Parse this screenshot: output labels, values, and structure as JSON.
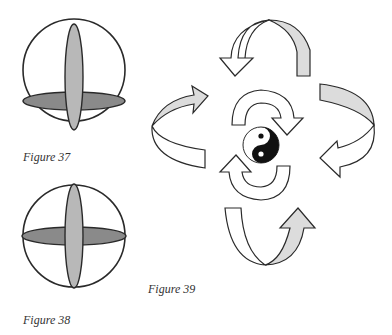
{
  "figures": [
    {
      "id": "37",
      "caption": "Figure 37",
      "description": "sphere with vertical and horizontal ellipses; horizontal ellipse lower"
    },
    {
      "id": "38",
      "caption": "Figure 38",
      "description": "sphere with vertical and horizontal ellipses centered"
    },
    {
      "id": "39",
      "caption": "Figure 39",
      "description": "yin-yang symbol surrounded by circulating arrows"
    }
  ],
  "colors": {
    "stroke": "#2a2a2a",
    "ellipse_vertical_fill": "#b8b8b8",
    "ellipse_horizontal_fill": "#8a8a8a",
    "arrow_shade": "#dcdcdc",
    "yin": "#111111",
    "yang": "#ffffff"
  }
}
